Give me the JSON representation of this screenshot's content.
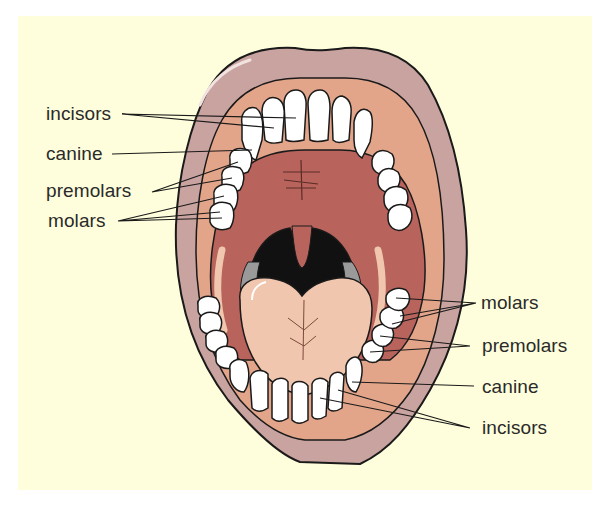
{
  "figure": {
    "colors": {
      "background": "#fffedc",
      "lip": "#c9a3a0",
      "gum": "#e3a58a",
      "palate": "#b8645c",
      "throat": "#111111",
      "tongue": "#f1c6ae",
      "tooth": "#ffffff",
      "outline": "#1a1a1a",
      "label_text": "#2a2a2a"
    }
  },
  "labels": {
    "upper_left": [
      {
        "text": "incisors",
        "target": "upper incisors"
      },
      {
        "text": "canine",
        "target": "upper canine"
      },
      {
        "text": "premolars",
        "target": "upper premolars"
      },
      {
        "text": "molars",
        "target": "upper molars"
      }
    ],
    "lower_right": [
      {
        "text": "molars",
        "target": "lower molars"
      },
      {
        "text": "premolars",
        "target": "lower premolars"
      },
      {
        "text": "canine",
        "target": "lower canine"
      },
      {
        "text": "incisors",
        "target": "lower incisors"
      }
    ]
  }
}
